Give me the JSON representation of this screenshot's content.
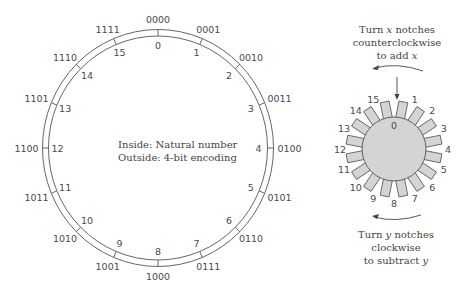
{
  "ring": {
    "center": [
      158,
      148
    ],
    "outer_radius": [
      115.5,
      118.5
    ],
    "inner_radius": [
      109.5,
      112
    ],
    "inside_labels": [
      "0",
      "1",
      "2",
      "3",
      "4",
      "5",
      "6",
      "7",
      "8",
      "9",
      "10",
      "11",
      "12",
      "13",
      "14",
      "15"
    ],
    "outside_labels": [
      "0000",
      "0001",
      "0010",
      "0011",
      "0100",
      "0101",
      "0110",
      "0111",
      "1000",
      "1001",
      "1010",
      "1011",
      "1100",
      "1101",
      "1110",
      "1111"
    ],
    "stroke_color": "#555555"
  },
  "center_note": {
    "line1": "Inside: Natural number",
    "line2": "Outside: 4-bit encoding"
  },
  "gear": {
    "center": [
      394,
      149
    ],
    "radius": 32,
    "fill": "#d4d4d4",
    "labels": [
      "0",
      "1",
      "2",
      "3",
      "4",
      "5",
      "6",
      "7",
      "8",
      "9",
      "10",
      "11",
      "12",
      "13",
      "14",
      "15"
    ]
  },
  "top_caption": {
    "line1_a": "Turn ",
    "line1_var": "x",
    "line1_b": " notches",
    "line2": "counterclockwise",
    "line3_a": "to add ",
    "line3_var": "x"
  },
  "bottom_caption": {
    "line1_a": "Turn ",
    "line1_var": "y",
    "line1_b": " notches",
    "line2": "clockwise",
    "line3_a": "to subtract ",
    "line3_var": "y"
  }
}
